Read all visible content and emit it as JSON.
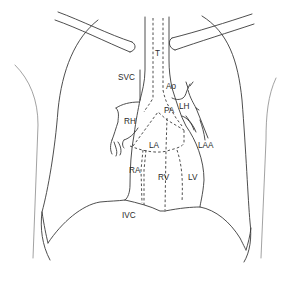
{
  "diagram": {
    "type": "anatomical line drawing",
    "line_color": "#3a3a3a",
    "background": "#ffffff",
    "labels": {
      "trachea": "T",
      "svc": "SVC",
      "aorta": "Ao",
      "pulmonary_artery": "PA",
      "left_hilum": "LH",
      "right_hilum": "RH",
      "left_atrium": "LA",
      "left_atrial_appendage": "LAA",
      "right_atrium": "RA",
      "right_ventricle": "RV",
      "left_ventricle": "LV",
      "ivc": "IVC"
    }
  }
}
